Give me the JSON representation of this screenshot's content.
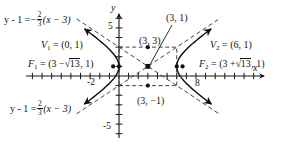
{
  "figure": {
    "kind": "hyperbola-graph",
    "axes": {
      "x_label": "x",
      "y_label": "y",
      "x_ticks": [
        {
          "value": -2,
          "label": "-2"
        },
        {
          "value": 8,
          "label": "8"
        }
      ],
      "y_ticks": [
        {
          "value": 5,
          "label": "5"
        },
        {
          "value": -5,
          "label": "-5"
        }
      ],
      "x_range": [
        -3.5,
        11.5
      ],
      "y_range": [
        -6.5,
        6.2
      ],
      "tick_step": 1
    },
    "labels": {
      "asymptote_upper_left": {
        "lhs": "y - 1 =",
        "sign": "−",
        "num": "2",
        "den": "3",
        "rhs": "(x − 3)"
      },
      "asymptote_lower_left": {
        "lhs": "y - 1 =",
        "sign": "",
        "num": "2",
        "den": "3",
        "rhs": "(x − 3)"
      },
      "vertex_left": {
        "name": "V",
        "sub": "1",
        "eq": "= (0, 1)"
      },
      "vertex_right": {
        "name": "V",
        "sub": "2",
        "eq": "= (6, 1)"
      },
      "focus_left": {
        "name": "F",
        "sub": "1",
        "pre": "= (3 −",
        "radicand": "13",
        "post": ", 1)"
      },
      "focus_right": {
        "name": "F",
        "sub": "2",
        "pre": "= (3 +",
        "radicand": "13",
        "post": ", 1)"
      },
      "center": "(3, 1)",
      "co_vertex_upper": "(3, 3)",
      "co_vertex_lower": "(3, −1)"
    },
    "points": [
      {
        "name": "center",
        "label": "(3, 1)",
        "x": 3,
        "y": 1
      },
      {
        "name": "co-vertex-upper",
        "label": "(3, 3)",
        "x": 3,
        "y": 3
      },
      {
        "name": "co-vertex-lower",
        "label": "(3, -1)",
        "x": 3,
        "y": -1
      },
      {
        "name": "vertex-left",
        "label": "V1 = (0, 1)",
        "x": 0,
        "y": 1
      },
      {
        "name": "vertex-right",
        "label": "V2 = (6, 1)",
        "x": 6,
        "y": 1
      },
      {
        "name": "focus-left",
        "label": "F1 = (3 - sqrt13, 1)",
        "x": -0.6056,
        "y": 1
      },
      {
        "name": "focus-right",
        "label": "F2 = (3 + sqrt13, 1)",
        "x": 6.6056,
        "y": 1
      }
    ],
    "hyperbola": {
      "center": [
        3,
        1
      ],
      "a": 3,
      "b": 2,
      "c": 3.6056,
      "orientation": "horizontal",
      "asymptote_slopes": [
        0.6667,
        -0.6667
      ]
    },
    "box": {
      "x_min": 0,
      "x_max": 6,
      "y_min": -1,
      "y_max": 3
    },
    "colors": {
      "ink": "#141414",
      "curve": "#111111",
      "dash": "#3a3a3a",
      "background": "#ffffff"
    }
  }
}
